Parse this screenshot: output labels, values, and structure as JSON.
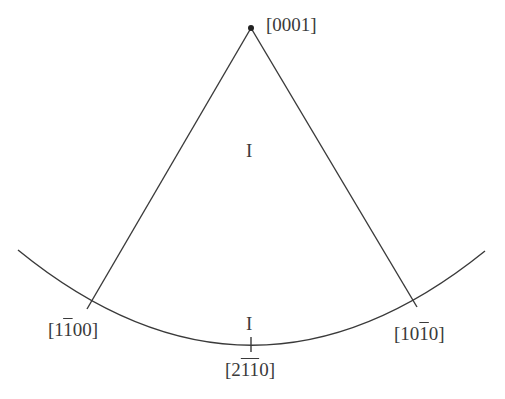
{
  "diagram": {
    "type": "stereographic-triangle",
    "stroke_color": "#3a3a3a",
    "apex": {
      "label": "[0001]",
      "parts": [
        {
          "t": "[0001]",
          "bar": false
        }
      ]
    },
    "left_pole": {
      "label": "[1̄100]",
      "parts": [
        {
          "t": "[1",
          "bar": false
        },
        {
          "t": "1",
          "bar": true
        },
        {
          "t": "00]",
          "bar": false
        }
      ]
    },
    "right_pole": {
      "label": "[101̄0]",
      "parts": [
        {
          "t": "[10",
          "bar": false
        },
        {
          "t": "1",
          "bar": true
        },
        {
          "t": "0]",
          "bar": false
        }
      ]
    },
    "bottom_pole": {
      "label": "[21̄11̄0]",
      "parts": [
        {
          "t": "[2",
          "bar": false
        },
        {
          "t": "11",
          "bar": true
        },
        {
          "t": "0]",
          "bar": false
        }
      ]
    },
    "region_labels": {
      "center": "I",
      "bottom": "I"
    }
  }
}
